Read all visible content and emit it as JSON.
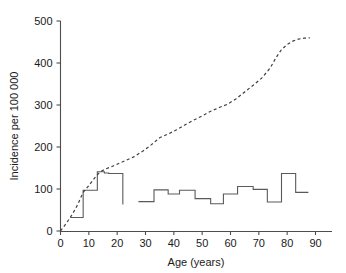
{
  "chart_data": {
    "type": "line",
    "title": "",
    "subtitle": "",
    "xlabel": "Age (years)",
    "ylabel": "Incidence per 100 000",
    "xlim": [
      0,
      95
    ],
    "ylim": [
      0,
      500
    ],
    "xticks": [
      0,
      10,
      20,
      30,
      40,
      50,
      60,
      70,
      80,
      90
    ],
    "xtick_labels": [
      "0",
      "10",
      "20",
      "30",
      "40",
      "50",
      "60",
      "70",
      "80",
      "90"
    ],
    "yticks": [
      0,
      100,
      200,
      300,
      400,
      500
    ],
    "ytick_labels": [
      "0",
      "100",
      "200",
      "300",
      "400",
      "500"
    ],
    "grid": false,
    "legend": null,
    "series": [
      {
        "name": "step-series-young",
        "style": "step",
        "linestyle": "solid",
        "color": "#5a5a5a",
        "steps": [
          {
            "x_start": 3.5,
            "x_end": 8.0,
            "value": 32
          },
          {
            "x_start": 8.0,
            "x_end": 13.0,
            "value": 97
          },
          {
            "x_start": 13.0,
            "x_end": 15.5,
            "value": 141
          },
          {
            "x_start": 15.5,
            "x_end": 17.0,
            "value": 138
          },
          {
            "x_start": 17.0,
            "x_end": 22.0,
            "value": 137
          }
        ],
        "drop_to": 63
      },
      {
        "name": "step-series-adult",
        "style": "step",
        "linestyle": "solid",
        "color": "#5a5a5a",
        "steps": [
          {
            "x_start": 27.5,
            "x_end": 33.0,
            "value": 70
          },
          {
            "x_start": 33.0,
            "x_end": 38.0,
            "value": 98
          },
          {
            "x_start": 38.0,
            "x_end": 42.0,
            "value": 88
          },
          {
            "x_start": 42.0,
            "x_end": 47.5,
            "value": 97
          },
          {
            "x_start": 47.5,
            "x_end": 53.0,
            "value": 77
          },
          {
            "x_start": 53.0,
            "x_end": 57.5,
            "value": 65
          },
          {
            "x_start": 57.5,
            "x_end": 62.5,
            "value": 88
          },
          {
            "x_start": 62.5,
            "x_end": 68.0,
            "value": 106
          },
          {
            "x_start": 68.0,
            "x_end": 73.0,
            "value": 99
          },
          {
            "x_start": 73.0,
            "x_end": 78.0,
            "value": 69
          },
          {
            "x_start": 78.0,
            "x_end": 83.0,
            "value": 137
          },
          {
            "x_start": 83.0,
            "x_end": 87.5,
            "value": 92
          }
        ]
      },
      {
        "name": "cumulative-dashed-curve",
        "style": "line",
        "linestyle": "dashed",
        "color": "#3f3f3f",
        "points": [
          {
            "x": 0,
            "y": 0
          },
          {
            "x": 2,
            "y": 18
          },
          {
            "x": 4,
            "y": 38
          },
          {
            "x": 6,
            "y": 62
          },
          {
            "x": 8,
            "y": 92
          },
          {
            "x": 10,
            "y": 108
          },
          {
            "x": 12,
            "y": 126
          },
          {
            "x": 14,
            "y": 141
          },
          {
            "x": 16,
            "y": 148
          },
          {
            "x": 18,
            "y": 153
          },
          {
            "x": 20,
            "y": 159
          },
          {
            "x": 23,
            "y": 168
          },
          {
            "x": 26,
            "y": 177
          },
          {
            "x": 29,
            "y": 190
          },
          {
            "x": 32,
            "y": 205
          },
          {
            "x": 35,
            "y": 222
          },
          {
            "x": 38,
            "y": 231
          },
          {
            "x": 41,
            "y": 241
          },
          {
            "x": 44,
            "y": 253
          },
          {
            "x": 47,
            "y": 264
          },
          {
            "x": 50,
            "y": 274
          },
          {
            "x": 53,
            "y": 285
          },
          {
            "x": 56,
            "y": 294
          },
          {
            "x": 59,
            "y": 302
          },
          {
            "x": 62,
            "y": 315
          },
          {
            "x": 65,
            "y": 331
          },
          {
            "x": 68,
            "y": 347
          },
          {
            "x": 71,
            "y": 364
          },
          {
            "x": 74,
            "y": 388
          },
          {
            "x": 76,
            "y": 412
          },
          {
            "x": 78,
            "y": 432
          },
          {
            "x": 80,
            "y": 444
          },
          {
            "x": 82,
            "y": 452
          },
          {
            "x": 84,
            "y": 457
          },
          {
            "x": 86,
            "y": 459
          },
          {
            "x": 88,
            "y": 460
          }
        ]
      }
    ]
  },
  "axes": {
    "x_title": "Age (years)",
    "y_title": "Incidence per 100 000"
  }
}
